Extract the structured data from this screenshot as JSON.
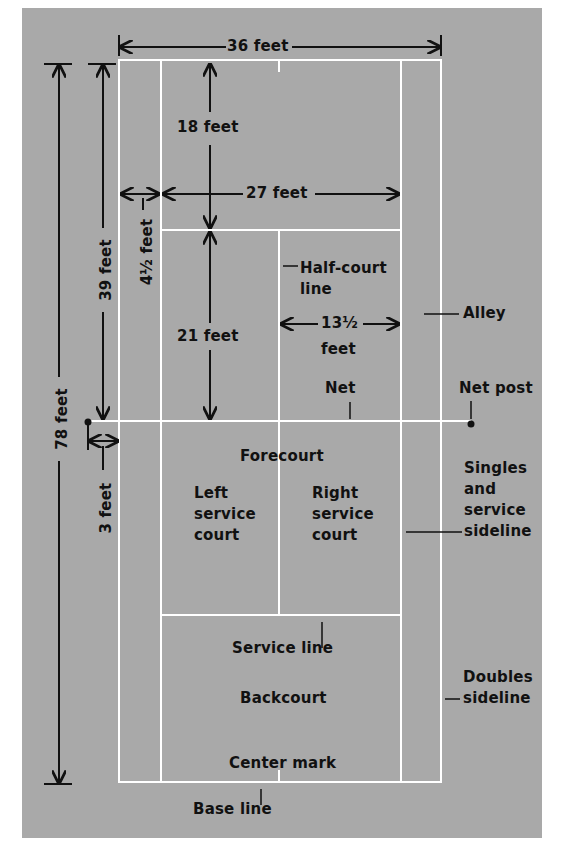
{
  "diagram": {
    "colors": {
      "background": "#a9a9a9",
      "lines": "#ffffff",
      "ink": "#111111",
      "page": "#ffffff"
    },
    "dimensions": {
      "width_doubles": "36 feet",
      "width_singles": "27 feet",
      "alley_width": "4½ feet",
      "half_length": "39 feet",
      "full_length": "78 feet",
      "net_to_service": "21 feet",
      "service_to_base": "18 feet",
      "service_court_width_num": "13½",
      "service_court_width_unit": "feet",
      "net_post_offset": "3 feet"
    },
    "labels": {
      "half_court_line_1": "Half-court",
      "half_court_line_2": "line",
      "alley": "Alley",
      "net": "Net",
      "net_post": "Net post",
      "forecourt": "Forecourt",
      "left_service_court": [
        "Left",
        "service",
        "court"
      ],
      "right_service_court": [
        "Right",
        "service",
        "court"
      ],
      "singles_sideline": [
        "Singles",
        "and",
        "service",
        "sideline"
      ],
      "service_line": "Service line",
      "backcourt": "Backcourt",
      "doubles_sideline": [
        "Doubles",
        "sideline"
      ],
      "center_mark": "Center mark",
      "base_line": "Base line"
    }
  }
}
